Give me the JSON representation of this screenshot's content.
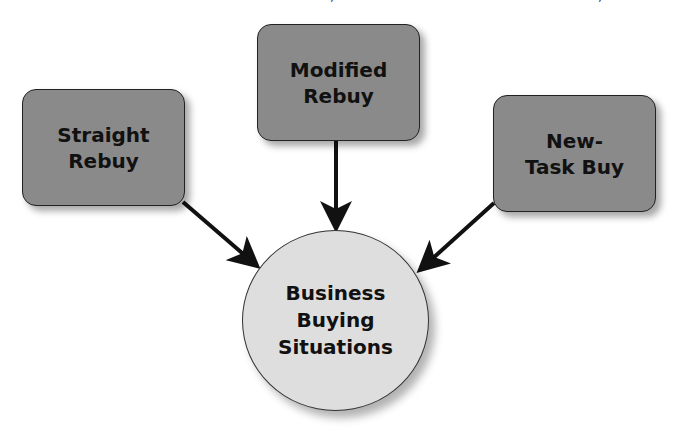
{
  "top_fragment": {
    "text_left": "…",
    "text_middle": ",",
    "text_right": ","
  },
  "diagram": {
    "title": "Business Buying Situations",
    "colors": {
      "box_fill": "#8a8a8a",
      "hub_fill": "#dedede",
      "arrow": "#111111",
      "border": "#222222"
    },
    "nodes": [
      {
        "id": "straight-rebuy",
        "line1": "Straight",
        "line2": "Rebuy"
      },
      {
        "id": "modified-rebuy",
        "line1": "Modified",
        "line2": "Rebuy"
      },
      {
        "id": "new-task-buy",
        "line1": "New-",
        "line2": "Task Buy"
      }
    ],
    "hub": {
      "line1": "Business",
      "line2": "Buying",
      "line3": "Situations"
    },
    "edges": [
      {
        "from": "straight-rebuy",
        "to": "hub"
      },
      {
        "from": "modified-rebuy",
        "to": "hub"
      },
      {
        "from": "new-task-buy",
        "to": "hub"
      }
    ]
  }
}
